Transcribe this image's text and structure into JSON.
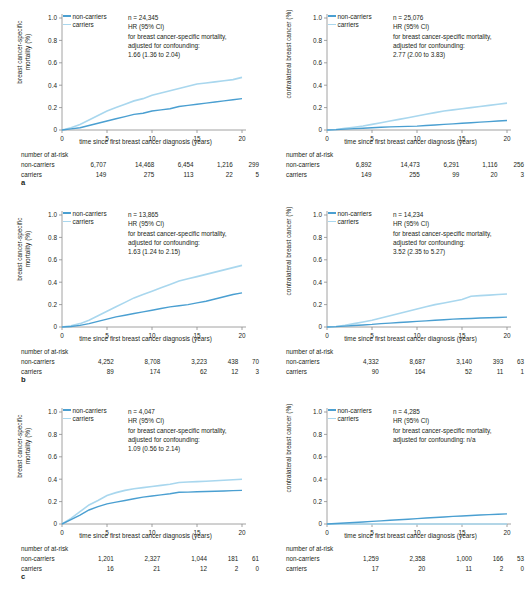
{
  "figure": {
    "axis_color": "#8c8c8c",
    "colors": {
      "non_carriers": "#4a9fd1",
      "carriers": "#a9d7ee"
    },
    "xlabel": "time since first breast cancer diagnosis (years)",
    "ylabel_mortality": "breast cancer-specific mortality (%)",
    "ylabel_contralateral": "contralateral breast cancer (%)",
    "xticks": [
      "0",
      "5",
      "10",
      "15",
      "20"
    ],
    "yticks": [
      "0",
      "0.2",
      "0.4",
      "0.6",
      "0.8",
      "1.0"
    ],
    "legend": {
      "non_carriers": "non-carriers",
      "carriers": "carriers"
    },
    "atrisk_title": "number of at-risk",
    "atrisk_rows": {
      "non_carriers": "non-carriers",
      "carriers": "carriers"
    },
    "hr_lines": {
      "hr_label": "HR (95% CI)",
      "outcome_label": "for breast cancer-specific mortality,",
      "adjust_label": "adjusted for confounding:"
    }
  },
  "panels": [
    {
      "letter": "a",
      "left": {
        "ylabel": "breast cancer-specific mortality (%)",
        "ylabel_lines": [
          "breast cancer-specific",
          "mortality (%)"
        ],
        "n_text": "n = 24,345",
        "hr_label": "HR (95% CI)",
        "outcome_label": "for breast cancer-specific mortality,",
        "adjust_label": "adjusted for confounding:",
        "hr_value": "1.66 (1.36 to 2.04)",
        "atrisk": {
          "non_carriers": [
            "6,707",
            "14,468",
            "6,454",
            "1,216",
            "299"
          ],
          "carriers": [
            "149",
            "275",
            "113",
            "22",
            "5"
          ]
        },
        "chart_data": {
          "type": "line",
          "title": "",
          "xlabel": "time since first breast cancer diagnosis (years)",
          "ylabel": "breast cancer-specific mortality (%)",
          "xlim": [
            0,
            20
          ],
          "ylim": [
            0,
            1.0
          ],
          "grid": false,
          "legend_position": "top-left",
          "x": [
            0,
            1,
            2,
            3,
            4,
            5,
            6,
            7,
            8,
            9,
            10,
            11,
            12,
            13,
            14,
            15,
            16,
            17,
            18,
            19,
            20
          ],
          "series": [
            {
              "name": "carriers",
              "values": [
                0,
                0.02,
                0.05,
                0.09,
                0.13,
                0.17,
                0.2,
                0.23,
                0.26,
                0.28,
                0.31,
                0.33,
                0.35,
                0.37,
                0.39,
                0.41,
                0.42,
                0.43,
                0.44,
                0.45,
                0.47
              ]
            },
            {
              "name": "non-carriers",
              "values": [
                0,
                0.01,
                0.02,
                0.04,
                0.06,
                0.08,
                0.1,
                0.12,
                0.14,
                0.15,
                0.17,
                0.18,
                0.19,
                0.21,
                0.22,
                0.23,
                0.24,
                0.25,
                0.26,
                0.27,
                0.28
              ]
            }
          ]
        }
      },
      "right": {
        "ylabel": "contralateral breast cancer (%)",
        "ylabel_lines": [
          "contralateral breast cancer (%)"
        ],
        "n_text": "n = 25,076",
        "hr_label": "HR (95% CI)",
        "outcome_label": "for breast cancer-specific mortality,",
        "adjust_label": "adjusted for confounding:",
        "hr_value": "2.77 (2.00 to 3.83)",
        "atrisk": {
          "non_carriers": [
            "6,892",
            "14,473",
            "6,291",
            "1,116",
            "256"
          ],
          "carriers": [
            "149",
            "255",
            "99",
            "20",
            "3"
          ]
        },
        "chart_data": {
          "type": "line",
          "title": "",
          "xlabel": "time since first breast cancer diagnosis (years)",
          "ylabel": "contralateral breast cancer (%)",
          "xlim": [
            0,
            20
          ],
          "ylim": [
            0,
            1.0
          ],
          "grid": false,
          "legend_position": "top-left",
          "x": [
            0,
            1,
            2,
            3,
            4,
            5,
            6,
            7,
            8,
            9,
            10,
            11,
            12,
            13,
            14,
            15,
            16,
            17,
            18,
            19,
            20
          ],
          "series": [
            {
              "name": "carriers",
              "values": [
                0,
                0.005,
                0.015,
                0.025,
                0.035,
                0.05,
                0.065,
                0.08,
                0.095,
                0.11,
                0.125,
                0.14,
                0.155,
                0.17,
                0.18,
                0.19,
                0.2,
                0.21,
                0.22,
                0.23,
                0.24
              ]
            },
            {
              "name": "non-carriers",
              "values": [
                0,
                0.003,
                0.008,
                0.012,
                0.016,
                0.02,
                0.025,
                0.028,
                0.03,
                0.032,
                0.035,
                0.04,
                0.045,
                0.05,
                0.055,
                0.06,
                0.065,
                0.07,
                0.075,
                0.08,
                0.085
              ]
            }
          ]
        }
      }
    },
    {
      "letter": "b",
      "left": {
        "ylabel": "breast cancer-specific mortality (%)",
        "ylabel_lines": [
          "breast cancer-specific",
          "mortality (%)"
        ],
        "n_text": "n = 13,865",
        "hr_label": "HR (95% CI)",
        "outcome_label": "for breast cancer-specific mortality,",
        "adjust_label": "adjusted for confounding:",
        "hr_value": "1.63 (1.24 to 2.15)",
        "atrisk": {
          "non_carriers": [
            "4,252",
            "8,708",
            "3,223",
            "438",
            "70"
          ],
          "carriers": [
            "89",
            "174",
            "62",
            "12",
            "3"
          ]
        },
        "chart_data": {
          "type": "line",
          "title": "",
          "xlabel": "time since first breast cancer diagnosis (years)",
          "ylabel": "breast cancer-specific mortality (%)",
          "xlim": [
            0,
            20
          ],
          "ylim": [
            0,
            1.0
          ],
          "grid": false,
          "legend_position": "top-left",
          "x": [
            0,
            1,
            2,
            3,
            4,
            5,
            6,
            7,
            8,
            9,
            10,
            11,
            12,
            13,
            14,
            15,
            16,
            17,
            18,
            19,
            20
          ],
          "series": [
            {
              "name": "carriers",
              "values": [
                0,
                0.01,
                0.03,
                0.06,
                0.1,
                0.14,
                0.18,
                0.22,
                0.26,
                0.29,
                0.32,
                0.35,
                0.38,
                0.41,
                0.43,
                0.45,
                0.47,
                0.49,
                0.51,
                0.53,
                0.55
              ]
            },
            {
              "name": "non-carriers",
              "values": [
                0,
                0.005,
                0.015,
                0.03,
                0.05,
                0.07,
                0.09,
                0.105,
                0.12,
                0.135,
                0.15,
                0.165,
                0.18,
                0.19,
                0.2,
                0.215,
                0.23,
                0.25,
                0.27,
                0.29,
                0.305
              ]
            }
          ]
        }
      },
      "right": {
        "ylabel": "contralateral breast cancer (%)",
        "ylabel_lines": [
          "contralateral breast cancer (%)"
        ],
        "n_text": "n = 14,234",
        "hr_label": "HR (95% CI)",
        "outcome_label": "for breast cancer-specific mortality,",
        "adjust_label": "adjusted for confounding:",
        "hr_value": "3.52 (2.35 to 5.27)",
        "atrisk": {
          "non_carriers": [
            "4,332",
            "8,687",
            "3,140",
            "393",
            "63"
          ],
          "carriers": [
            "90",
            "164",
            "52",
            "11",
            "1"
          ]
        },
        "chart_data": {
          "type": "line",
          "title": "",
          "xlabel": "time since first breast cancer diagnosis (years)",
          "ylabel": "contralateral breast cancer (%)",
          "xlim": [
            0,
            20
          ],
          "ylim": [
            0,
            1.0
          ],
          "grid": false,
          "legend_position": "top-left",
          "x": [
            0,
            1,
            2,
            3,
            4,
            5,
            6,
            7,
            8,
            9,
            10,
            11,
            12,
            13,
            14,
            15,
            16,
            17,
            18,
            19,
            20
          ],
          "series": [
            {
              "name": "carriers",
              "values": [
                0,
                0.005,
                0.015,
                0.03,
                0.045,
                0.06,
                0.08,
                0.1,
                0.12,
                0.14,
                0.16,
                0.18,
                0.2,
                0.215,
                0.23,
                0.245,
                0.275,
                0.28,
                0.285,
                0.29,
                0.295
              ]
            },
            {
              "name": "non-carriers",
              "values": [
                0,
                0.003,
                0.008,
                0.013,
                0.018,
                0.023,
                0.03,
                0.035,
                0.04,
                0.045,
                0.05,
                0.055,
                0.06,
                0.065,
                0.07,
                0.073,
                0.076,
                0.08,
                0.082,
                0.085,
                0.088
              ]
            }
          ]
        }
      }
    },
    {
      "letter": "c",
      "left": {
        "ylabel": "breast cancer-specific mortality (%)",
        "ylabel_lines": [
          "breast cancer-specific",
          "mortality (%)"
        ],
        "n_text": "n = 4,047",
        "hr_label": "HR (95% CI)",
        "outcome_label": "for breast cancer-specific mortality,",
        "adjust_label": "adjusted for confounding:",
        "hr_value": "1.09 (0.56 to 2.14)",
        "atrisk": {
          "non_carriers": [
            "1,201",
            "2,327",
            "1,044",
            "181",
            "61"
          ],
          "carriers": [
            "16",
            "21",
            "12",
            "2",
            "0"
          ]
        },
        "chart_data": {
          "type": "line",
          "title": "",
          "xlabel": "time since first breast cancer diagnosis (years)",
          "ylabel": "breast cancer-specific mortality (%)",
          "xlim": [
            0,
            20
          ],
          "ylim": [
            0,
            1.0
          ],
          "grid": false,
          "legend_position": "top-left",
          "x": [
            0,
            1,
            2,
            3,
            4,
            5,
            6,
            7,
            8,
            9,
            10,
            11,
            12,
            13,
            14,
            15,
            16,
            17,
            18,
            19,
            20
          ],
          "series": [
            {
              "name": "carriers",
              "values": [
                0,
                0.05,
                0.11,
                0.17,
                0.21,
                0.255,
                0.28,
                0.3,
                0.315,
                0.325,
                0.335,
                0.345,
                0.355,
                0.37,
                0.375,
                0.378,
                0.382,
                0.386,
                0.39,
                0.395,
                0.4
              ]
            },
            {
              "name": "non-carriers",
              "values": [
                0,
                0.04,
                0.08,
                0.125,
                0.155,
                0.18,
                0.195,
                0.21,
                0.225,
                0.24,
                0.25,
                0.26,
                0.27,
                0.283,
                0.285,
                0.288,
                0.29,
                0.292,
                0.295,
                0.298,
                0.3
              ]
            }
          ]
        }
      },
      "right": {
        "ylabel": "contralateral breast cancer (%)",
        "ylabel_lines": [
          "contralateral breast cancer (%)"
        ],
        "n_text": "n = 4,285",
        "hr_label": "HR (95% CI)",
        "outcome_label": "for breast cancer-specific mortality,",
        "adjust_label": "adjusted for confounding: n/a",
        "hr_value": "",
        "atrisk": {
          "non_carriers": [
            "1,259",
            "2,358",
            "1,000",
            "166",
            "53"
          ],
          "carriers": [
            "17",
            "20",
            "11",
            "2",
            "0"
          ]
        },
        "chart_data": {
          "type": "line",
          "title": "",
          "xlabel": "time since first breast cancer diagnosis (years)",
          "ylabel": "contralateral breast cancer (%)",
          "xlim": [
            0,
            20
          ],
          "ylim": [
            0,
            1.0
          ],
          "grid": false,
          "legend_position": "top-left",
          "x": [
            0,
            1,
            2,
            3,
            4,
            5,
            6,
            7,
            8,
            9,
            10,
            11,
            12,
            13,
            14,
            15,
            16,
            17,
            18,
            19,
            20
          ],
          "series": [
            {
              "name": "carriers",
              "values": [
                0,
                0,
                0,
                0,
                0,
                0,
                0,
                0,
                0,
                0,
                0,
                0,
                0,
                0,
                0,
                0,
                0,
                0,
                0,
                0,
                0
              ]
            },
            {
              "name": "non-carriers",
              "values": [
                0,
                0.004,
                0.009,
                0.013,
                0.018,
                0.023,
                0.028,
                0.033,
                0.038,
                0.043,
                0.048,
                0.053,
                0.058,
                0.063,
                0.068,
                0.072,
                0.076,
                0.08,
                0.084,
                0.087,
                0.09
              ]
            }
          ]
        }
      }
    }
  ]
}
